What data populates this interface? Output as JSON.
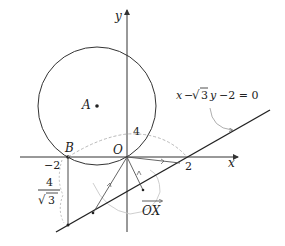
{
  "diagram": {
    "axes": {
      "x_label": "x",
      "y_label": "y",
      "origin_label": "O"
    },
    "points": {
      "A": "A",
      "B": "B"
    },
    "ticks": {
      "neg_two": "−2",
      "two": "2",
      "four": "4"
    },
    "fraction": {
      "numerator": "4",
      "denominator": "3",
      "sqrt": "√"
    },
    "line_equation": {
      "x": "x",
      "minus1": "−",
      "sqrt": "√",
      "three": "3",
      "y": "y",
      "rest": "−2 = 0"
    },
    "vector_label": "OX",
    "colors": {
      "stroke": "#333333",
      "dashed": "#b0b0b0"
    }
  }
}
